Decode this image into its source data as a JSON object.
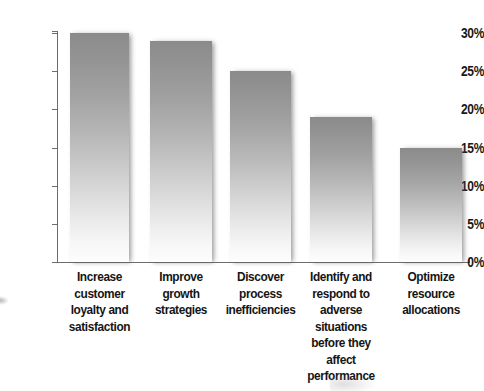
{
  "chart_data": {
    "type": "bar",
    "title": "",
    "subtitle": "",
    "xlabel": "",
    "ylabel": "",
    "categories": [
      "Increase\ncustomer\nloyalty and\nsatisfaction",
      "Improve\ngrowth\nstrategies",
      "Discover\nprocess\ninefficiencies",
      "Identify and\nrespond to\nadverse\nsituations\nbefore they\naffect\nperformance",
      "Optimize\nresource\nallocations"
    ],
    "values": [
      30,
      29,
      25,
      19,
      15
    ],
    "value_labels": [
      "30%",
      "29%",
      "25%",
      "19%",
      "15%"
    ],
    "ylim": [
      0,
      30
    ],
    "ytick_values": [
      0,
      5,
      10,
      15,
      20,
      25,
      30
    ],
    "ytick_labels": [
      "0%",
      "5%",
      "10%",
      "15%",
      "20%",
      "25%",
      "30%"
    ],
    "grid": false,
    "legend": "none",
    "bar_fill": "vertical-gradient-gray-to-white",
    "bar_color_top": "#8b8b8b",
    "bar_color_bottom": "#fdfdfd",
    "axis_color": "#6d6d6d",
    "text_color": "#151515",
    "background": "#ffffff"
  }
}
